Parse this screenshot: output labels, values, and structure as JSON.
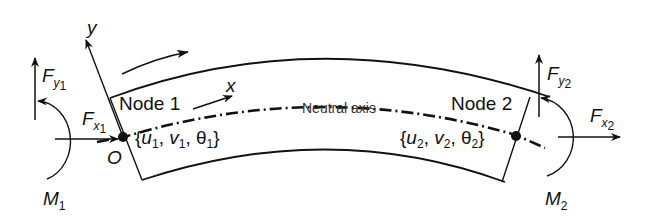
{
  "diagram": {
    "type": "curved-beam-element",
    "element": {
      "node1_label": "Node 1",
      "node2_label": "Node 2",
      "neutral_axis_label": "Neutral axis",
      "origin_label": "O"
    },
    "axes": {
      "x_label": "x",
      "y_label": "y"
    },
    "node1": {
      "dof": {
        "open": "{",
        "u": "u",
        "u_sub": "1",
        "sep1": ", ",
        "v": "v",
        "v_sub": "1",
        "sep2": ", ",
        "theta": "θ",
        "theta_sub": "1",
        "close": "}"
      },
      "forces": {
        "fy": "F",
        "fy_sub": "y",
        "fy_subsub": "1",
        "fx": "F",
        "fx_sub": "x",
        "fx_subsub": "1",
        "m": "M",
        "m_sub": "1"
      }
    },
    "node2": {
      "dof": {
        "open": "{",
        "u": "u",
        "u_sub": "2",
        "sep1": ", ",
        "v": "v",
        "v_sub": "2",
        "sep2": ", ",
        "theta": "θ",
        "theta_sub": "2",
        "close": "}"
      },
      "forces": {
        "fy": "F",
        "fy_sub": "y",
        "fy_subsub": "2",
        "fx": "F",
        "fx_sub": "x",
        "fx_subsub": "2",
        "m": "M",
        "m_sub": "2"
      }
    },
    "colors": {
      "stroke": "#111111",
      "background": "#ffffff"
    }
  }
}
